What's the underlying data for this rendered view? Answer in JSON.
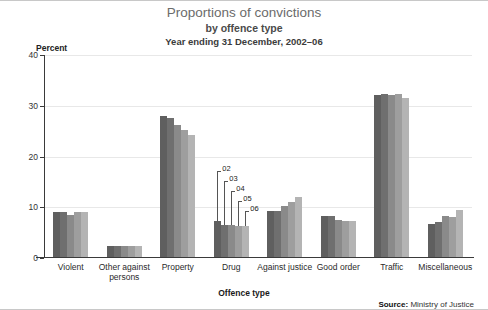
{
  "chart_data": {
    "type": "bar",
    "title": "Proportions of convictions",
    "subtitle": "by offence type",
    "daterange": "Year ending 31 December, 2002–06",
    "xlabel": "Offence type",
    "ylabel": "Percent",
    "ylim": [
      0,
      40
    ],
    "yticks": [
      0,
      10,
      20,
      30,
      40
    ],
    "grid": true,
    "legend_position": "inline-annotations",
    "categories": [
      "Violent",
      "Other against persons",
      "Property",
      "Drug",
      "Against justice",
      "Good order",
      "Traffic",
      "Miscellaneous"
    ],
    "series": [
      {
        "name": "02",
        "color": "#5f5f5f",
        "values": [
          9.1,
          2.3,
          28.0,
          7.2,
          9.2,
          8.3,
          32.2,
          6.7
        ]
      },
      {
        "name": "03",
        "color": "#6f6f6f",
        "values": [
          9.1,
          2.3,
          27.5,
          6.6,
          9.3,
          8.2,
          32.3,
          7.1
        ]
      },
      {
        "name": "04",
        "color": "#8a8a8a",
        "values": [
          8.4,
          2.3,
          26.3,
          6.5,
          10.2,
          7.4,
          32.1,
          8.3
        ]
      },
      {
        "name": "05",
        "color": "#9e9e9e",
        "values": [
          9.1,
          2.4,
          25.2,
          6.3,
          11.1,
          7.3,
          32.4,
          8.1
        ]
      },
      {
        "name": "06",
        "color": "#b4b4b4",
        "values": [
          9.1,
          2.4,
          24.3,
          6.4,
          12.1,
          7.3,
          31.5,
          9.4
        ]
      }
    ],
    "annotations": [
      {
        "label": "02",
        "series": "02"
      },
      {
        "label": "03",
        "series": "03"
      },
      {
        "label": "04",
        "series": "04"
      },
      {
        "label": "05",
        "series": "05"
      },
      {
        "label": "06",
        "series": "06"
      }
    ]
  },
  "source": {
    "label": "Source:",
    "value": "Ministry of Justice"
  }
}
